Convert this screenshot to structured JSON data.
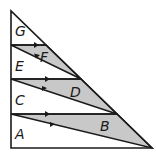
{
  "diagram": {
    "labels": {
      "G": "G",
      "F": "F",
      "E": "E",
      "D": "D",
      "C": "C",
      "B": "B",
      "A": "A"
    },
    "colors": {
      "stroke": "#1a1a1a",
      "shade": "#c8c8c8",
      "background": "#ffffff"
    }
  }
}
